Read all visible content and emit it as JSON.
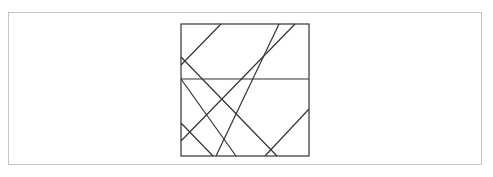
{
  "diagram": {
    "type": "line-arrangement-in-square",
    "colors": {
      "frame_border": "#c4c4c4",
      "line": "#333333",
      "background": "#ffffff"
    },
    "square": {
      "x": 181,
      "y": 24,
      "width": 128,
      "height": 132
    },
    "horizontal_divider": {
      "x1": 181,
      "y1": 79,
      "x2": 309,
      "y2": 79
    },
    "lines": [
      {
        "id": "A",
        "x1": 221,
        "y1": 24,
        "x2": 181,
        "y2": 65
      },
      {
        "id": "B",
        "x1": 279,
        "y1": 24,
        "x2": 216,
        "y2": 156
      },
      {
        "id": "C",
        "x1": 295,
        "y1": 24,
        "x2": 181,
        "y2": 141
      },
      {
        "id": "D",
        "x1": 181,
        "y1": 57,
        "x2": 277,
        "y2": 156
      },
      {
        "id": "E",
        "x1": 181,
        "y1": 79,
        "x2": 236,
        "y2": 156
      },
      {
        "id": "F",
        "x1": 181,
        "y1": 123,
        "x2": 213,
        "y2": 156
      },
      {
        "id": "G",
        "x1": 309,
        "y1": 109,
        "x2": 265,
        "y2": 156
      }
    ]
  }
}
